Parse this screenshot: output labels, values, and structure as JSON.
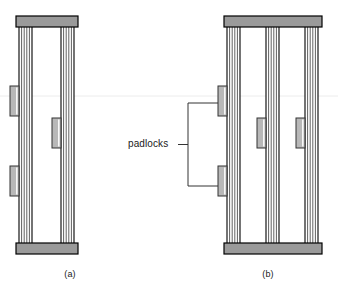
{
  "figure": {
    "panels": [
      {
        "id": "a",
        "caption": "(a)",
        "description": "Single pair of stacked slats secured with three padlocks",
        "frame": {
          "x": 16,
          "y": 16,
          "width": 62,
          "height": 238
        },
        "cap_color": "#9a9a9a",
        "cap_border": "#000000",
        "cap_height": 11,
        "column_groups": [
          {
            "x": 19,
            "width": 13,
            "lines": 6
          },
          {
            "x": 61,
            "width": 13,
            "lines": 6
          }
        ],
        "padlocks": [
          {
            "x": 10,
            "y": 86,
            "width": 9,
            "height": 30,
            "label": "padlock-left-upper"
          },
          {
            "x": 52,
            "y": 118,
            "width": 9,
            "height": 30,
            "label": "padlock-middle"
          },
          {
            "x": 10,
            "y": 166,
            "width": 9,
            "height": 30,
            "label": "padlock-left-lower"
          }
        ]
      },
      {
        "id": "b",
        "caption": "(b)",
        "description": "Three stacked slat groups secured with three padlocks",
        "frame": {
          "x": 224,
          "y": 16,
          "width": 98,
          "height": 238
        },
        "cap_color": "#9a9a9a",
        "cap_border": "#000000",
        "cap_height": 11,
        "column_groups": [
          {
            "x": 227,
            "width": 13,
            "lines": 6
          },
          {
            "x": 266,
            "width": 13,
            "lines": 6
          },
          {
            "x": 305,
            "width": 13,
            "lines": 6
          }
        ],
        "padlocks": [
          {
            "x": 218,
            "y": 86,
            "width": 9,
            "height": 30,
            "label": "padlock-left-upper"
          },
          {
            "x": 257,
            "y": 118,
            "width": 9,
            "height": 30,
            "label": "padlock-middle"
          },
          {
            "x": 296,
            "y": 118,
            "width": 9,
            "height": 30,
            "label": "padlock-right"
          },
          {
            "x": 218,
            "y": 166,
            "width": 9,
            "height": 30,
            "label": "padlock-left-lower"
          }
        ]
      }
    ],
    "annotation": {
      "label": "padlocks",
      "label_x": 128,
      "label_y": 138,
      "bracket": {
        "stem_x": 178,
        "stem_y": 145,
        "spine_x": 188,
        "top_y": 103,
        "bottom_y": 186,
        "arm_end_x": 218
      },
      "line_color": "#333333"
    },
    "colors": {
      "background": "#ffffff",
      "outline": "#000000",
      "slat_fill": "#9a9a9a",
      "slat_line": "#444444",
      "padlock_fill": "#b8b8b8",
      "padlock_border": "#333333",
      "text": "#1a1a1a",
      "faint_rule": "#e8e8e8"
    },
    "faint_rule_y": 96,
    "captions": {
      "a": "(a)",
      "b": "(b)"
    }
  }
}
